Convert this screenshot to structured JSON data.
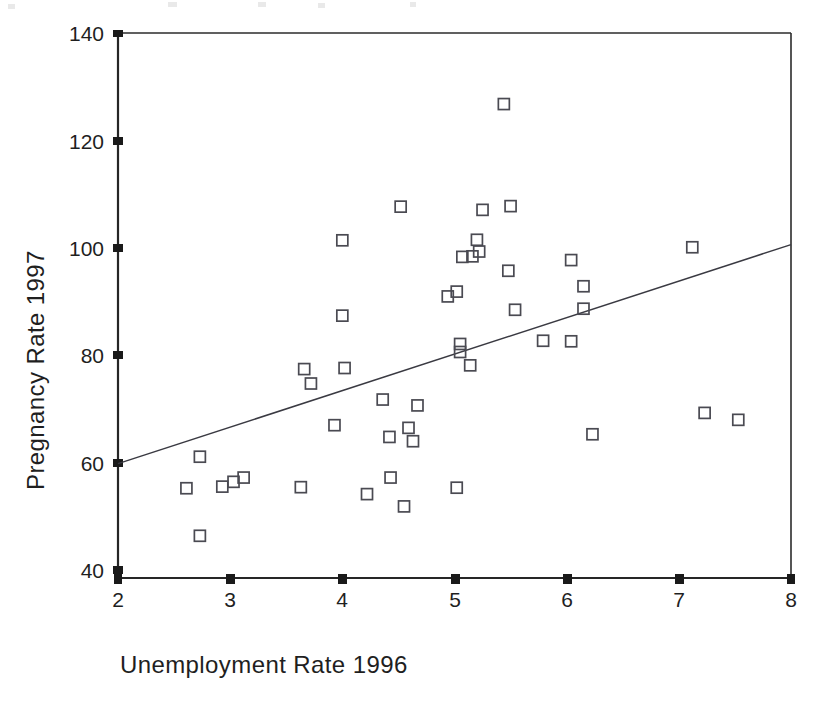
{
  "chart_data": {
    "type": "scatter",
    "title": "",
    "xlabel": "Unemployment Rate 1996",
    "ylabel": "Pregnancy Rate 1997",
    "xlim": [
      2,
      8
    ],
    "ylim": [
      38,
      140
    ],
    "xticks": [
      2,
      3,
      4,
      5,
      6,
      7,
      8
    ],
    "xtick_labels": [
      "2",
      "3",
      "4",
      "5",
      "6",
      "7",
      "8"
    ],
    "yticks": [
      40,
      60,
      80,
      100,
      120,
      140
    ],
    "ytick_labels": [
      "40",
      "60",
      "80",
      "100",
      "120",
      "140"
    ],
    "grid": false,
    "legend": null,
    "marker": "open-square",
    "points": [
      {
        "x": 2.61,
        "y": 54.8
      },
      {
        "x": 2.73,
        "y": 60.7
      },
      {
        "x": 2.73,
        "y": 45.9
      },
      {
        "x": 2.93,
        "y": 55.1
      },
      {
        "x": 3.03,
        "y": 56.0
      },
      {
        "x": 3.12,
        "y": 56.8
      },
      {
        "x": 3.63,
        "y": 55.0
      },
      {
        "x": 3.66,
        "y": 77.1
      },
      {
        "x": 3.72,
        "y": 74.4
      },
      {
        "x": 3.93,
        "y": 66.6
      },
      {
        "x": 4.0,
        "y": 101.2
      },
      {
        "x": 4.0,
        "y": 87.1
      },
      {
        "x": 4.02,
        "y": 77.3
      },
      {
        "x": 4.22,
        "y": 53.7
      },
      {
        "x": 4.36,
        "y": 71.4
      },
      {
        "x": 4.42,
        "y": 64.4
      },
      {
        "x": 4.43,
        "y": 56.8
      },
      {
        "x": 4.52,
        "y": 107.5
      },
      {
        "x": 4.55,
        "y": 51.4
      },
      {
        "x": 4.59,
        "y": 66.1
      },
      {
        "x": 4.63,
        "y": 63.6
      },
      {
        "x": 4.67,
        "y": 70.3
      },
      {
        "x": 4.94,
        "y": 90.7
      },
      {
        "x": 5.02,
        "y": 91.6
      },
      {
        "x": 5.02,
        "y": 54.9
      },
      {
        "x": 5.05,
        "y": 81.8
      },
      {
        "x": 5.05,
        "y": 80.3
      },
      {
        "x": 5.07,
        "y": 98.1
      },
      {
        "x": 5.16,
        "y": 98.2
      },
      {
        "x": 5.14,
        "y": 77.8
      },
      {
        "x": 5.2,
        "y": 101.3
      },
      {
        "x": 5.22,
        "y": 99.1
      },
      {
        "x": 5.25,
        "y": 106.9
      },
      {
        "x": 5.44,
        "y": 126.7
      },
      {
        "x": 5.48,
        "y": 95.5
      },
      {
        "x": 5.5,
        "y": 107.6
      },
      {
        "x": 5.54,
        "y": 88.2
      },
      {
        "x": 5.79,
        "y": 82.4
      },
      {
        "x": 6.04,
        "y": 82.3
      },
      {
        "x": 6.04,
        "y": 97.5
      },
      {
        "x": 6.15,
        "y": 92.6
      },
      {
        "x": 6.15,
        "y": 88.4
      },
      {
        "x": 6.23,
        "y": 64.9
      },
      {
        "x": 7.12,
        "y": 99.9
      },
      {
        "x": 7.23,
        "y": 68.9
      },
      {
        "x": 7.53,
        "y": 67.6
      }
    ],
    "fit_line": {
      "type": "linear-regression",
      "x_start": 2,
      "y_start": 59.4,
      "x_end": 8,
      "y_end": 100.4
    }
  },
  "axis": {
    "x_title": "Unemployment Rate 1996",
    "y_title": "Pregnancy Rate 1997"
  }
}
